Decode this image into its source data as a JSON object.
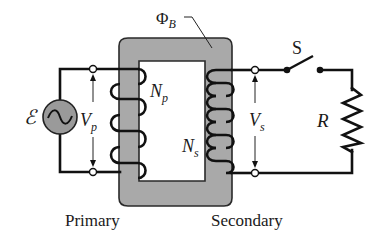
{
  "diagram": {
    "labels": {
      "flux_symbol": "Φ",
      "flux_subscript": "B",
      "emf": "ℰ",
      "primary_voltage": "V",
      "primary_voltage_sub": "p",
      "primary_turns": "N",
      "primary_turns_sub": "p",
      "secondary_turns": "N",
      "secondary_turns_sub": "s",
      "secondary_voltage": "V",
      "secondary_voltage_sub": "s",
      "switch": "S",
      "resistor": "R",
      "primary_caption": "Primary",
      "secondary_caption": "Secondary"
    },
    "components": [
      {
        "id": "ac-source",
        "type": "AC voltage source",
        "label": "ℰ"
      },
      {
        "id": "iron-core",
        "type": "transformer core",
        "label": "ΦB"
      },
      {
        "id": "primary-coil",
        "type": "winding",
        "label": "Np",
        "turns_shown": 4
      },
      {
        "id": "secondary-coil",
        "type": "winding",
        "label": "Ns",
        "turns_shown": 8
      },
      {
        "id": "switch",
        "type": "open switch",
        "label": "S"
      },
      {
        "id": "load-resistor",
        "type": "resistor",
        "label": "R"
      }
    ],
    "colors": {
      "core_fill": "#a9a9a9",
      "core_stroke": "#2a2a2a",
      "source_fill": "#9a9a9a",
      "wire": "#111111",
      "background": "#ffffff"
    }
  }
}
